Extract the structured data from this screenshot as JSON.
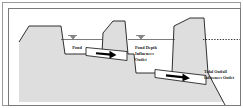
{
  "figure": {
    "kind": "engineering-cross-section-illustration"
  },
  "colors": {
    "ground_fill": "#dedede",
    "ground_stroke": "#1a1a1a",
    "frame_outer": "#9a9a9a",
    "frame_inner": "#7a7a7a",
    "pipe_fill": "#ffffff",
    "pipe_stroke": "#1a1a1a",
    "arrow_fill": "#000000",
    "water_line": "#333333",
    "page_background": "#ffffff",
    "text": "#1a1a1a"
  },
  "labels": {
    "pond": "Pond",
    "pond_depth_outlet": [
      "Pond Depth",
      "Influences",
      "Outlet"
    ],
    "tidal_outfall_outlet": [
      "Tidal Outfall",
      "Influences Outlet"
    ]
  },
  "symbols": {
    "pond_water_surface": "water-surface-triangle",
    "mid_water_surface": "water-surface-triangle",
    "tidal_water_surface": "dashed-water-line",
    "flow_left": "flow-arrow-right",
    "flow_right": "flow-arrow-right"
  },
  "features": [
    {
      "name": "upland-embankment",
      "description": "left high ground sloping down to pond"
    },
    {
      "name": "pond-basin",
      "description": "flat pond bed with water surface"
    },
    {
      "name": "first-berm",
      "description": "trapezoidal berm separating pond from intermediate basin"
    },
    {
      "name": "upper-outlet-pipe",
      "description": "outlet pipe through first berm with flow arrow"
    },
    {
      "name": "intermediate-basin",
      "description": "lower flat bed downstream of first berm"
    },
    {
      "name": "second-berm",
      "description": "tall trapezoidal berm at tidal boundary"
    },
    {
      "name": "lower-outlet-pipe",
      "description": "outlet pipe through second berm with flow arrow"
    },
    {
      "name": "tidal-channel-slope",
      "description": "ground sloping down to tidal outfall on right"
    },
    {
      "name": "tidal-water-surface-dashed",
      "description": "dashed tidal water level line extending right"
    }
  ]
}
